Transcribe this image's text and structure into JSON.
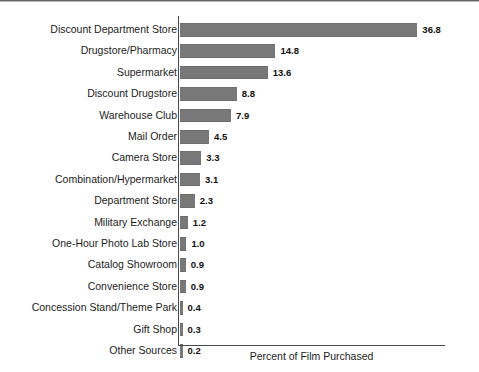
{
  "chart_data": {
    "type": "bar",
    "orientation": "horizontal",
    "title": "",
    "xlabel": "Percent of Film Purchased",
    "ylabel": "",
    "xlim": [
      0,
      41
    ],
    "grid": false,
    "legend": null,
    "categories": [
      "Discount Department Store",
      "Drugstore/Pharmacy",
      "Supermarket",
      "Discount Drugstore",
      "Warehouse Club",
      "Mail Order",
      "Camera Store",
      "Combination/Hypermarket",
      "Department Store",
      "Military Exchange",
      "One-Hour Photo Lab Store",
      "Catalog Showroom",
      "Convenience Store",
      "Concession Stand/Theme Park",
      "Gift Shop",
      "Other Sources"
    ],
    "values": [
      36.8,
      14.8,
      13.6,
      8.8,
      7.9,
      4.5,
      3.3,
      3.1,
      2.3,
      1.2,
      1.0,
      0.9,
      0.9,
      0.4,
      0.3,
      0.2
    ],
    "value_labels": [
      "36.8",
      "14.8",
      "13.6",
      "8.8",
      "7.9",
      "4.5",
      "3.3",
      "3.1",
      "2.3",
      "1.2",
      "1.0",
      "0.9",
      "0.9",
      "0.4",
      "0.3",
      "0.2"
    ],
    "bar_color": "#787878",
    "axis_color": "#4a4a4a",
    "background_color": "#ffffff"
  },
  "axis": {
    "x_title": "Percent of Film Purchased"
  }
}
